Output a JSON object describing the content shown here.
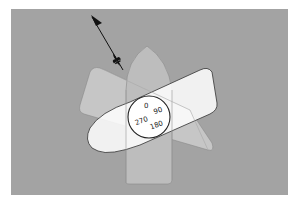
{
  "diagram": {
    "background": "#a0a0a0",
    "panel": {
      "x": 11,
      "y": 9,
      "w": 277,
      "h": 186
    },
    "compass": {
      "labels": [
        "0",
        "90",
        "180",
        "270"
      ],
      "cx": 149,
      "cy": 117,
      "r": 21
    },
    "wind_arrow": {
      "from": [
        123,
        70
      ],
      "to": [
        92,
        17
      ],
      "icon": "fleur-de-lis-icon"
    },
    "shapes": [
      {
        "name": "hull",
        "fill": "#b8b8b8"
      },
      {
        "name": "sail-triangle",
        "fill": "#c4c4c4"
      },
      {
        "name": "rotated-board",
        "fill": "#ffffff"
      }
    ]
  }
}
